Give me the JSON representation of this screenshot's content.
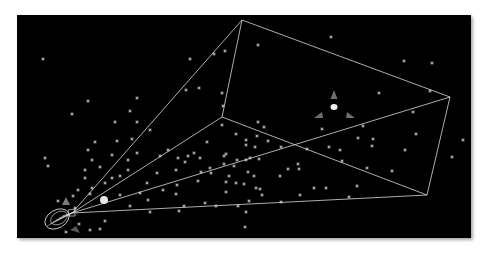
{
  "viewport": {
    "label": "3d-viewport",
    "background": "#000000",
    "frame": {
      "x": 17,
      "y": 15,
      "width": 454,
      "height": 223
    }
  },
  "colors": {
    "line": "#d8d8d8",
    "star": "#cfcfcf",
    "gizmo_cone": "#6e6e6e",
    "gizmo_center": "#f2f2f2",
    "sphere": "#e6e6e6",
    "camera_wire": "#e0e0e0",
    "camera_marker": "#7a7a7a"
  },
  "camera": {
    "origin": [
      72,
      213
    ],
    "body_center": [
      57,
      219
    ]
  },
  "frustum": {
    "far_plane": [
      [
        242,
        20
      ],
      [
        450,
        97
      ],
      [
        427,
        195
      ],
      [
        222,
        117
      ]
    ],
    "apex": [
      72,
      213
    ]
  },
  "light_gizmo": {
    "center": [
      334,
      107
    ],
    "cones": [
      [
        334,
        95
      ],
      [
        319,
        116
      ],
      [
        350,
        116
      ]
    ]
  },
  "sphere": {
    "center": [
      104,
      200
    ],
    "r": 4
  },
  "stars": [
    [
      43,
      59
    ],
    [
      88,
      101
    ],
    [
      72,
      114
    ],
    [
      45,
      158
    ],
    [
      137,
      98
    ],
    [
      130,
      111
    ],
    [
      137,
      122
    ],
    [
      115,
      122
    ],
    [
      132,
      139
    ],
    [
      117,
      141
    ],
    [
      137,
      153
    ],
    [
      150,
      130
    ],
    [
      186,
      90
    ],
    [
      190,
      59
    ],
    [
      199,
      88
    ],
    [
      214,
      54
    ],
    [
      225,
      51
    ],
    [
      222,
      93
    ],
    [
      223,
      106
    ],
    [
      222,
      125
    ],
    [
      258,
      45
    ],
    [
      331,
      37
    ],
    [
      404,
      61
    ],
    [
      432,
      63
    ],
    [
      405,
      150
    ],
    [
      392,
      171
    ],
    [
      463,
      140
    ],
    [
      452,
      157
    ],
    [
      430,
      91
    ],
    [
      379,
      93
    ],
    [
      363,
      126
    ],
    [
      373,
      139
    ],
    [
      367,
      168
    ],
    [
      342,
      161
    ],
    [
      329,
      147
    ],
    [
      322,
      129
    ],
    [
      307,
      149
    ],
    [
      299,
      169
    ],
    [
      288,
      169
    ],
    [
      268,
      141
    ],
    [
      255,
      147
    ],
    [
      250,
      158
    ],
    [
      257,
      136
    ],
    [
      281,
      147
    ],
    [
      264,
      127
    ],
    [
      259,
      159
    ],
    [
      246,
      160
    ],
    [
      246,
      145
    ],
    [
      246,
      140
    ],
    [
      258,
      122
    ],
    [
      236,
      134
    ],
    [
      224,
      156
    ],
    [
      207,
      142
    ],
    [
      194,
      153
    ],
    [
      185,
      162
    ],
    [
      188,
      156
    ],
    [
      178,
      158
    ],
    [
      168,
      150
    ],
    [
      160,
      156
    ],
    [
      157,
      173
    ],
    [
      147,
      183
    ],
    [
      140,
      193
    ],
    [
      148,
      200
    ],
    [
      163,
      190
    ],
    [
      176,
      194
    ],
    [
      177,
      185
    ],
    [
      176,
      170
    ],
    [
      200,
      158
    ],
    [
      210,
      168
    ],
    [
      226,
      182
    ],
    [
      198,
      181
    ],
    [
      201,
      172
    ],
    [
      229,
      176
    ],
    [
      236,
      183
    ],
    [
      254,
      176
    ],
    [
      260,
      189
    ],
    [
      211,
      173
    ],
    [
      224,
      164
    ],
    [
      234,
      166
    ],
    [
      226,
      154
    ],
    [
      237,
      160
    ],
    [
      248,
      172
    ],
    [
      226,
      192
    ],
    [
      216,
      206
    ],
    [
      238,
      206
    ],
    [
      249,
      201
    ],
    [
      262,
      195
    ],
    [
      246,
      212
    ],
    [
      205,
      203
    ],
    [
      179,
      211
    ],
    [
      150,
      212
    ],
    [
      130,
      206
    ],
    [
      120,
      195
    ],
    [
      105,
      183
    ],
    [
      112,
      178
    ],
    [
      92,
      188
    ],
    [
      85,
      178
    ],
    [
      92,
      160
    ],
    [
      100,
      167
    ],
    [
      85,
      170
    ],
    [
      90,
      194
    ],
    [
      88,
      150
    ],
    [
      78,
      190
    ],
    [
      48,
      166
    ],
    [
      120,
      176
    ],
    [
      128,
      170
    ],
    [
      128,
      160
    ],
    [
      112,
      155
    ],
    [
      95,
      142
    ],
    [
      79,
      224
    ],
    [
      90,
      230
    ],
    [
      100,
      229
    ],
    [
      105,
      221
    ],
    [
      66,
      232
    ],
    [
      75,
      208
    ],
    [
      73,
      196
    ],
    [
      58,
      201
    ],
    [
      280,
      176
    ],
    [
      300,
      195
    ],
    [
      314,
      188
    ],
    [
      349,
      197
    ],
    [
      357,
      186
    ],
    [
      281,
      202
    ],
    [
      245,
      227
    ],
    [
      358,
      138
    ],
    [
      372,
      146
    ],
    [
      416,
      134
    ],
    [
      413,
      112
    ],
    [
      340,
      150
    ],
    [
      326,
      188
    ],
    [
      298,
      164
    ],
    [
      244,
      184
    ],
    [
      256,
      188
    ],
    [
      184,
      206
    ]
  ]
}
